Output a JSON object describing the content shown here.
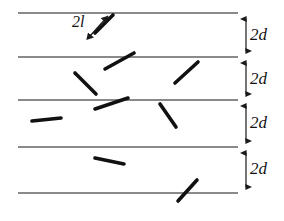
{
  "figure": {
    "type": "diagram",
    "name": "buffon-needle-grid",
    "background_color": "#ffffff",
    "width": 284,
    "height": 221
  },
  "colors": {
    "grid_line": "#8a8a8a",
    "needle": "#111111",
    "arrow": "#1a1a1a",
    "text": "#111111"
  },
  "grid": {
    "line_x_start": 18,
    "line_x_end": 238,
    "line_width": 1.1,
    "line_y_positions": [
      13,
      57,
      100,
      147,
      193
    ],
    "band_count": 4
  },
  "needle_label": {
    "text": "2l",
    "x": 72,
    "y": 14,
    "arrow": {
      "x1": 90,
      "y1": 36,
      "x2": 108,
      "y2": 16,
      "double_headed": true
    }
  },
  "spacing_labels": [
    {
      "text": "2d",
      "x": 250,
      "y": 26
    },
    {
      "text": "2d",
      "x": 250,
      "y": 70
    },
    {
      "text": "2d",
      "x": 250,
      "y": 114
    },
    {
      "text": "2d",
      "x": 250,
      "y": 160
    }
  ],
  "spacing_arrows": {
    "axis_x": 246,
    "segments": [
      {
        "y1": 14,
        "y2": 56
      },
      {
        "y1": 58,
        "y2": 99
      },
      {
        "y1": 101,
        "y2": 146
      },
      {
        "y1": 148,
        "y2": 192
      }
    ]
  },
  "needles": [
    {
      "id": "needle-1",
      "x1": 95,
      "y1": 33,
      "x2": 113,
      "y2": 15,
      "crosses_line": true
    },
    {
      "id": "needle-2",
      "x1": 105,
      "y1": 69,
      "x2": 134,
      "y2": 53,
      "crosses_line": true
    },
    {
      "id": "needle-3",
      "x1": 75,
      "y1": 73,
      "x2": 96,
      "y2": 94,
      "crosses_line": false
    },
    {
      "id": "needle-4",
      "x1": 175,
      "y1": 83,
      "x2": 198,
      "y2": 62,
      "crosses_line": false
    },
    {
      "id": "needle-5",
      "x1": 95,
      "y1": 109,
      "x2": 128,
      "y2": 98,
      "crosses_line": true
    },
    {
      "id": "needle-6",
      "x1": 32,
      "y1": 121,
      "x2": 61,
      "y2": 118,
      "crosses_line": false
    },
    {
      "id": "needle-7",
      "x1": 160,
      "y1": 104,
      "x2": 176,
      "y2": 127,
      "crosses_line": false
    },
    {
      "id": "needle-8",
      "x1": 95,
      "y1": 158,
      "x2": 124,
      "y2": 164,
      "crosses_line": false
    },
    {
      "id": "needle-9",
      "x1": 178,
      "y1": 201,
      "x2": 197,
      "y2": 180,
      "crosses_line": true
    }
  ],
  "needle_stroke_width": 3.6
}
